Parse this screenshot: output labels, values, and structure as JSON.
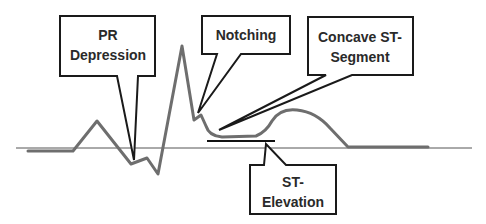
{
  "colors": {
    "waveform": "#6e6e6e",
    "baseline": "#444444",
    "callout_border": "#1a1a1a",
    "callout_fill": "#ffffff",
    "text": "#2a2a2a"
  },
  "callouts": [
    {
      "id": "pr-depression",
      "lines": [
        "PR",
        "Depression"
      ]
    },
    {
      "id": "notching",
      "lines": [
        "Notching"
      ]
    },
    {
      "id": "concave-st-segment",
      "lines": [
        "Concave ST-",
        "Segment"
      ]
    },
    {
      "id": "st-elevation",
      "lines": [
        "ST-",
        "Elevation"
      ]
    }
  ]
}
